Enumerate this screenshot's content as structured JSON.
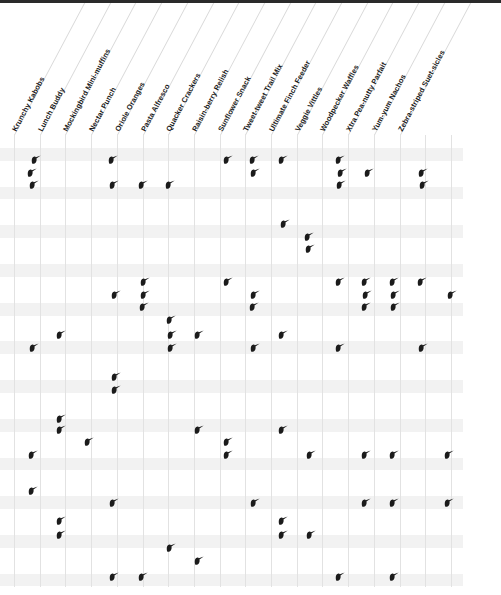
{
  "page": {
    "kind": "bird-food-preference-matrix",
    "icon_name": "bird-icon",
    "icon_color": "#1b1b1b",
    "background_color": "#ffffff",
    "grid_line_color": "#e2e2e2",
    "band_color": "#f2f2f2",
    "topbar_color": "#2a2a2a"
  },
  "columns": [
    "Krunchy Kabobs",
    "Lunch Buddy",
    "Mockingbird Mini-muffins",
    "Nectar Punch",
    "Oriole Oranges",
    "Pasta Alfresco",
    "Quacker Crackers",
    "Raisin-berry Relish",
    "Sunflower Snack",
    "Tweet-tweet Trail Mix",
    "Ultimate Finch Feeder",
    "Veggie Vittles",
    "Woodpecker Waffles",
    "Xtra Pea-nutty Parfait",
    "Yum-yum Nachos",
    "Zebra-striped Suet-sicles"
  ],
  "chart_data": {
    "type": "scatter",
    "title": "",
    "xlabel": "",
    "ylabel": "",
    "grid": true,
    "legend": "none",
    "n_columns": 16,
    "n_rows": 25,
    "marker": "bird-icon",
    "points": [
      {
        "col": 1,
        "row": 0,
        "x": 30,
        "y": 155
      },
      {
        "col": 4,
        "row": 0,
        "x": 107,
        "y": 155
      },
      {
        "col": 8,
        "row": 0,
        "x": 222,
        "y": 155
      },
      {
        "col": 9,
        "row": 0,
        "x": 248,
        "y": 155
      },
      {
        "col": 10,
        "row": 0,
        "x": 277,
        "y": 155
      },
      {
        "col": 12,
        "row": 0,
        "x": 334,
        "y": 155
      },
      {
        "col": 1,
        "row": 1,
        "x": 26,
        "y": 168
      },
      {
        "col": 9,
        "row": 1,
        "x": 249,
        "y": 168
      },
      {
        "col": 12,
        "row": 1,
        "x": 336,
        "y": 168
      },
      {
        "col": 13,
        "row": 1,
        "x": 363,
        "y": 168
      },
      {
        "col": 15,
        "row": 1,
        "x": 417,
        "y": 168
      },
      {
        "col": 1,
        "row": 2,
        "x": 28,
        "y": 180
      },
      {
        "col": 4,
        "row": 2,
        "x": 108,
        "y": 180
      },
      {
        "col": 5,
        "row": 2,
        "x": 137,
        "y": 180
      },
      {
        "col": 6,
        "row": 2,
        "x": 164,
        "y": 180
      },
      {
        "col": 12,
        "row": 2,
        "x": 335,
        "y": 180
      },
      {
        "col": 15,
        "row": 2,
        "x": 418,
        "y": 180
      },
      {
        "col": 10,
        "row": 4,
        "x": 279,
        "y": 219
      },
      {
        "col": 11,
        "row": 5,
        "x": 303,
        "y": 232
      },
      {
        "col": 11,
        "row": 6,
        "x": 304,
        "y": 244
      },
      {
        "col": 5,
        "row": 8,
        "x": 139,
        "y": 277
      },
      {
        "col": 8,
        "row": 8,
        "x": 222,
        "y": 277
      },
      {
        "col": 12,
        "row": 8,
        "x": 334,
        "y": 277
      },
      {
        "col": 13,
        "row": 8,
        "x": 360,
        "y": 277
      },
      {
        "col": 14,
        "row": 8,
        "x": 388,
        "y": 277
      },
      {
        "col": 15,
        "row": 8,
        "x": 416,
        "y": 277
      },
      {
        "col": 4,
        "row": 9,
        "x": 110,
        "y": 290
      },
      {
        "col": 5,
        "row": 9,
        "x": 139,
        "y": 290
      },
      {
        "col": 9,
        "row": 9,
        "x": 249,
        "y": 290
      },
      {
        "col": 13,
        "row": 9,
        "x": 361,
        "y": 290
      },
      {
        "col": 14,
        "row": 9,
        "x": 389,
        "y": 290
      },
      {
        "col": 17,
        "row": 9,
        "x": 446,
        "y": 290
      },
      {
        "col": 5,
        "row": 10,
        "x": 138,
        "y": 302
      },
      {
        "col": 9,
        "row": 10,
        "x": 248,
        "y": 302
      },
      {
        "col": 13,
        "row": 10,
        "x": 360,
        "y": 302
      },
      {
        "col": 14,
        "row": 10,
        "x": 389,
        "y": 302
      },
      {
        "col": 6,
        "row": 11,
        "x": 165,
        "y": 315
      },
      {
        "col": 2,
        "row": 12,
        "x": 55,
        "y": 330
      },
      {
        "col": 6,
        "row": 12,
        "x": 166,
        "y": 330
      },
      {
        "col": 7,
        "row": 12,
        "x": 193,
        "y": 330
      },
      {
        "col": 10,
        "row": 12,
        "x": 277,
        "y": 330
      },
      {
        "col": 1,
        "row": 13,
        "x": 28,
        "y": 343
      },
      {
        "col": 6,
        "row": 13,
        "x": 166,
        "y": 343
      },
      {
        "col": 9,
        "row": 13,
        "x": 249,
        "y": 343
      },
      {
        "col": 12,
        "row": 13,
        "x": 334,
        "y": 343
      },
      {
        "col": 15,
        "row": 13,
        "x": 417,
        "y": 343
      },
      {
        "col": 4,
        "row": 15,
        "x": 110,
        "y": 372
      },
      {
        "col": 4,
        "row": 16,
        "x": 110,
        "y": 385
      },
      {
        "col": 2,
        "row": 18,
        "x": 55,
        "y": 414
      },
      {
        "col": 2,
        "row": 19,
        "x": 55,
        "y": 425
      },
      {
        "col": 7,
        "row": 19,
        "x": 193,
        "y": 425
      },
      {
        "col": 10,
        "row": 19,
        "x": 277,
        "y": 425
      },
      {
        "col": 3,
        "row": 20,
        "x": 83,
        "y": 437
      },
      {
        "col": 8,
        "row": 20,
        "x": 222,
        "y": 437
      },
      {
        "col": 1,
        "row": 21,
        "x": 27,
        "y": 450
      },
      {
        "col": 8,
        "row": 21,
        "x": 222,
        "y": 450
      },
      {
        "col": 11,
        "row": 21,
        "x": 305,
        "y": 450
      },
      {
        "col": 13,
        "row": 21,
        "x": 360,
        "y": 450
      },
      {
        "col": 14,
        "row": 21,
        "x": 388,
        "y": 450
      },
      {
        "col": 16,
        "row": 21,
        "x": 443,
        "y": 450
      },
      {
        "col": 1,
        "row": 22,
        "x": 27,
        "y": 486
      },
      {
        "col": 4,
        "row": 22,
        "x": 108,
        "y": 498
      },
      {
        "col": 9,
        "row": 22,
        "x": 249,
        "y": 498
      },
      {
        "col": 13,
        "row": 22,
        "x": 360,
        "y": 498
      },
      {
        "col": 14,
        "row": 22,
        "x": 388,
        "y": 498
      },
      {
        "col": 16,
        "row": 22,
        "x": 443,
        "y": 498
      },
      {
        "col": 2,
        "row": 23,
        "x": 55,
        "y": 516
      },
      {
        "col": 10,
        "row": 23,
        "x": 277,
        "y": 516
      },
      {
        "col": 2,
        "row": 24,
        "x": 55,
        "y": 530
      },
      {
        "col": 10,
        "row": 24,
        "x": 277,
        "y": 530
      },
      {
        "col": 11,
        "row": 24,
        "x": 305,
        "y": 530
      },
      {
        "col": 6,
        "row": 25,
        "x": 165,
        "y": 543
      },
      {
        "col": 7,
        "row": 25,
        "x": 193,
        "y": 556
      },
      {
        "col": 4,
        "row": 26,
        "x": 108,
        "y": 572
      },
      {
        "col": 5,
        "row": 26,
        "x": 137,
        "y": 572
      },
      {
        "col": 12,
        "row": 26,
        "x": 334,
        "y": 572
      },
      {
        "col": 14,
        "row": 26,
        "x": 388,
        "y": 572
      }
    ]
  }
}
